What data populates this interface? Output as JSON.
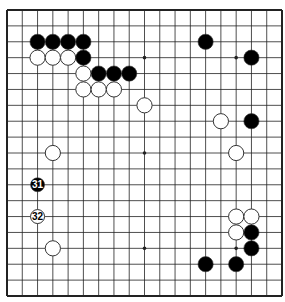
{
  "diagram": {
    "type": "go-board",
    "size": 19,
    "colors": {
      "background": "#ffffff",
      "line": "#222222",
      "black": "#000000",
      "white": "#ffffff",
      "stone_outline": "#333333"
    },
    "star_points": [
      [
        3,
        3
      ],
      [
        3,
        9
      ],
      [
        3,
        15
      ],
      [
        9,
        3
      ],
      [
        9,
        9
      ],
      [
        9,
        15
      ],
      [
        15,
        3
      ],
      [
        15,
        9
      ],
      [
        15,
        15
      ]
    ],
    "stones": [
      {
        "color": "black",
        "col": 2,
        "row": 2
      },
      {
        "color": "black",
        "col": 3,
        "row": 2
      },
      {
        "color": "black",
        "col": 4,
        "row": 2
      },
      {
        "color": "black",
        "col": 5,
        "row": 2
      },
      {
        "color": "black",
        "col": 13,
        "row": 2
      },
      {
        "color": "white",
        "col": 2,
        "row": 3
      },
      {
        "color": "white",
        "col": 3,
        "row": 3
      },
      {
        "color": "white",
        "col": 4,
        "row": 3
      },
      {
        "color": "black",
        "col": 5,
        "row": 3
      },
      {
        "color": "black",
        "col": 16,
        "row": 3
      },
      {
        "color": "white",
        "col": 5,
        "row": 4
      },
      {
        "color": "black",
        "col": 6,
        "row": 4
      },
      {
        "color": "black",
        "col": 7,
        "row": 4
      },
      {
        "color": "black",
        "col": 8,
        "row": 4
      },
      {
        "color": "white",
        "col": 5,
        "row": 5
      },
      {
        "color": "white",
        "col": 6,
        "row": 5
      },
      {
        "color": "white",
        "col": 7,
        "row": 5
      },
      {
        "color": "white",
        "col": 9,
        "row": 6
      },
      {
        "color": "white",
        "col": 14,
        "row": 7
      },
      {
        "color": "black",
        "col": 16,
        "row": 7
      },
      {
        "color": "white",
        "col": 3,
        "row": 9
      },
      {
        "color": "white",
        "col": 15,
        "row": 9
      },
      {
        "color": "black",
        "col": 2,
        "row": 11,
        "label": "31"
      },
      {
        "color": "white",
        "col": 2,
        "row": 13,
        "label": "32"
      },
      {
        "color": "white",
        "col": 15,
        "row": 13
      },
      {
        "color": "white",
        "col": 16,
        "row": 13
      },
      {
        "color": "white",
        "col": 15,
        "row": 14
      },
      {
        "color": "black",
        "col": 16,
        "row": 14
      },
      {
        "color": "white",
        "col": 3,
        "row": 15
      },
      {
        "color": "black",
        "col": 16,
        "row": 15
      },
      {
        "color": "black",
        "col": 13,
        "row": 16
      },
      {
        "color": "black",
        "col": 15,
        "row": 16
      }
    ],
    "move_labels": [
      "31",
      "32"
    ]
  }
}
